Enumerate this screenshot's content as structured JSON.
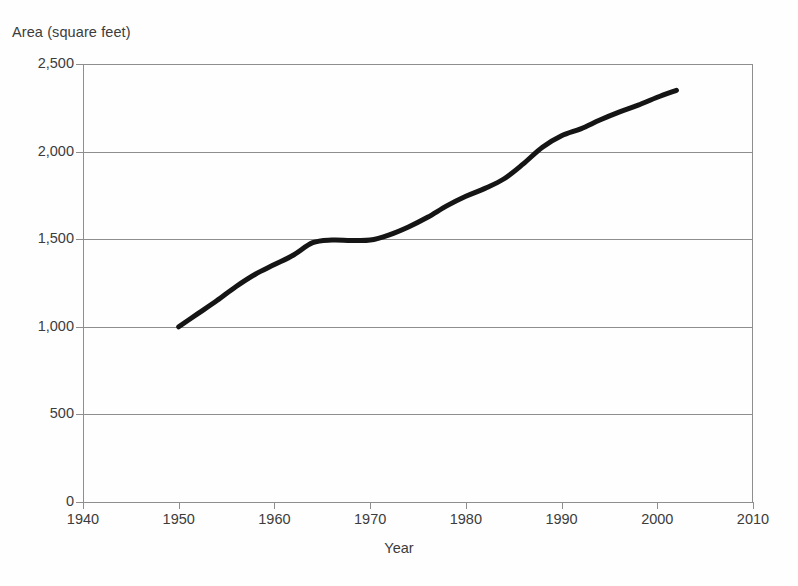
{
  "chart_data": {
    "type": "line",
    "title": "",
    "ylabel": "Area (square feet)",
    "xlabel": "Year",
    "xlim": [
      1940,
      2010
    ],
    "ylim": [
      0,
      2500
    ],
    "xticks": [
      1940,
      1950,
      1960,
      1970,
      1980,
      1990,
      2000,
      2010
    ],
    "xtick_labels": [
      "1940",
      "1950",
      "1960",
      "1970",
      "1980",
      "1990",
      "2000",
      "2010"
    ],
    "yticks": [
      0,
      500,
      1000,
      1500,
      2000,
      2500
    ],
    "ytick_labels": [
      "0",
      "500",
      "1,000",
      "1,500",
      "2,000",
      "2,500"
    ],
    "grid": "horizontal",
    "legend": "none",
    "series": [
      {
        "name": "Average new single-family home floor area",
        "color": "#151515",
        "line_width": 5,
        "x": [
          1950,
          1952,
          1954,
          1956,
          1958,
          1960,
          1962,
          1964,
          1966,
          1968,
          1970,
          1972,
          1974,
          1976,
          1978,
          1980,
          1982,
          1984,
          1986,
          1988,
          1990,
          1992,
          1994,
          1996,
          1998,
          2000,
          2002
        ],
        "values": [
          1000,
          1075,
          1150,
          1230,
          1300,
          1355,
          1410,
          1480,
          1495,
          1493,
          1495,
          1525,
          1570,
          1625,
          1690,
          1745,
          1790,
          1845,
          1930,
          2025,
          2090,
          2130,
          2180,
          2225,
          2265,
          2310,
          2350
        ]
      }
    ],
    "axis_color": "#8e8e8e",
    "background": "#ffffff"
  },
  "geometry": {
    "plot_left": 83,
    "plot_top": 64,
    "plot_width": 670,
    "plot_height": 438
  }
}
